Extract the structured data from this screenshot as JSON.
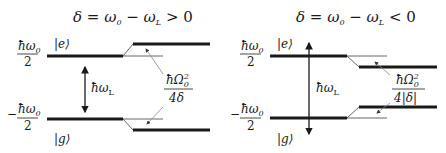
{
  "panels": [
    {
      "title": "δ = ω₀ − ω_L > 0",
      "title_parts": {
        "lhs": "δ = ω",
        "sub0": "0",
        "mid": " − ω",
        "subL": "L",
        "rel": " > 0"
      },
      "excited_state": "|e⟩",
      "ground_state": "|g⟩",
      "upper_energy": {
        "num": "ħω",
        "sub": "0",
        "den": "2"
      },
      "lower_energy": {
        "sign": "−",
        "num": "ħω",
        "sub": "0",
        "den": "2"
      },
      "laser_label": {
        "main": "ħω",
        "sub": "L"
      },
      "shift_label": {
        "num": "ħΩ",
        "sup": "2",
        "sub": "0",
        "den": "4δ"
      },
      "shift_direction": "levels repel (e up, g down)"
    },
    {
      "title": "δ = ω₀ − ω_L < 0",
      "title_parts": {
        "lhs": "δ = ω",
        "sub0": "0",
        "mid": " − ω",
        "subL": "L",
        "rel": " < 0"
      },
      "excited_state": "|e⟩",
      "ground_state": "|g⟩",
      "upper_energy": {
        "num": "ħω",
        "sub": "0",
        "den": "2"
      },
      "lower_energy": {
        "sign": "−",
        "num": "ħω",
        "sub": "0",
        "den": "2"
      },
      "laser_label": {
        "main": "ħω",
        "sub": "L"
      },
      "shift_label": {
        "num": "ħΩ",
        "sup": "2",
        "sub": "0",
        "den": "4|δ|"
      },
      "shift_direction": "levels attract (e down, g up)"
    }
  ],
  "colors": {
    "line": "#1a1a1a",
    "thin": "#555555",
    "pointer": "#888888"
  }
}
